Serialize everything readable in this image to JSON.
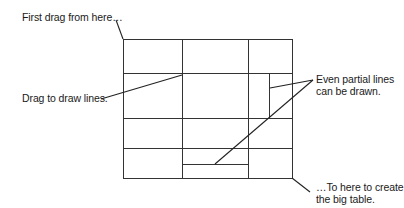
{
  "callouts": {
    "first_drag": "First drag from here…",
    "drag_lines": "Drag to draw lines.",
    "partial_line1": "Even partial lines",
    "partial_line2": "can be drawn.",
    "to_here_line1": "…To here to create",
    "to_here_line2": "the big table."
  },
  "table": {
    "left": 123,
    "right": 292,
    "top": 39,
    "bottom": 178,
    "columns_x": [
      182,
      248
    ],
    "rows_y": [
      73,
      118,
      148
    ],
    "partial_vertical": {
      "x": 269,
      "y1": 73,
      "y2": 118
    },
    "partial_horizontal": {
      "y": 164,
      "x1": 182,
      "x2": 248
    }
  },
  "colors": {
    "line": "#333333",
    "text": "#1a1a1a",
    "background": "#ffffff"
  }
}
